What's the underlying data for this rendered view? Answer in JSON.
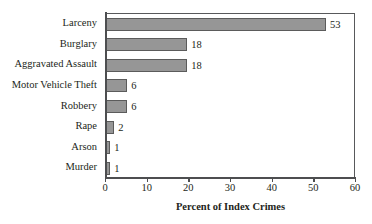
{
  "chart_data": {
    "type": "bar",
    "orientation": "horizontal",
    "title": "",
    "xlabel": "Percent of Index Crimes",
    "ylabel": "",
    "xlim": [
      0,
      60
    ],
    "xticks": [
      0,
      10,
      20,
      30,
      40,
      50,
      60
    ],
    "xtick_labels": [
      "0",
      "10",
      "20",
      "30",
      "40",
      "50",
      "60"
    ],
    "grid": false,
    "legend": null,
    "categories": [
      "Larceny",
      "Burglary",
      "Aggravated Assault",
      "Motor Vehicle Theft",
      "Robbery",
      "Rape",
      "Arson",
      "Murder"
    ],
    "values": [
      53,
      18,
      18,
      6,
      6,
      2,
      1,
      1
    ],
    "value_labels": [
      "53",
      "18",
      "18",
      "6",
      "6",
      "2",
      "1",
      "1"
    ],
    "bar_lengths_axis_units": [
      52.8,
      19.5,
      19.5,
      5.1,
      5.1,
      2.0,
      1.0,
      1.0
    ],
    "bar_fill_color": "#969696",
    "bar_edge_color": "#5b5b5b",
    "axis_color": "#4d4e50",
    "text_color": "#231f20",
    "background_color": "#ffffff"
  }
}
